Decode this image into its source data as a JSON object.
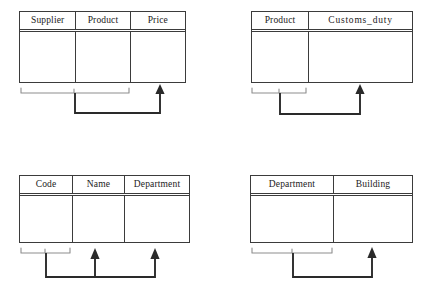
{
  "diagram": {
    "background_color": "#ffffff",
    "line_color": "#3b3b3b",
    "bracket_color": "#8d8d8d",
    "arrow_color": "#2a2a2a",
    "relations": [
      {
        "id": "supplier-product-price",
        "attributes": [
          "Supplier",
          "Product",
          "Price"
        ],
        "determinant": [
          "Supplier",
          "Product"
        ],
        "dependent": "Price"
      },
      {
        "id": "product-customs-duty",
        "attributes": [
          "Product",
          "Customs_duty"
        ],
        "determinant": [
          "Product"
        ],
        "dependent": "Customs_duty"
      },
      {
        "id": "code-name-department",
        "attributes": [
          "Code",
          "Name",
          "Department"
        ],
        "determinant": [
          "Code"
        ],
        "dependents": [
          "Name",
          "Department"
        ]
      },
      {
        "id": "department-building",
        "attributes": [
          "Department",
          "Building"
        ],
        "determinant": [
          "Department"
        ],
        "dependent": "Building"
      }
    ]
  }
}
